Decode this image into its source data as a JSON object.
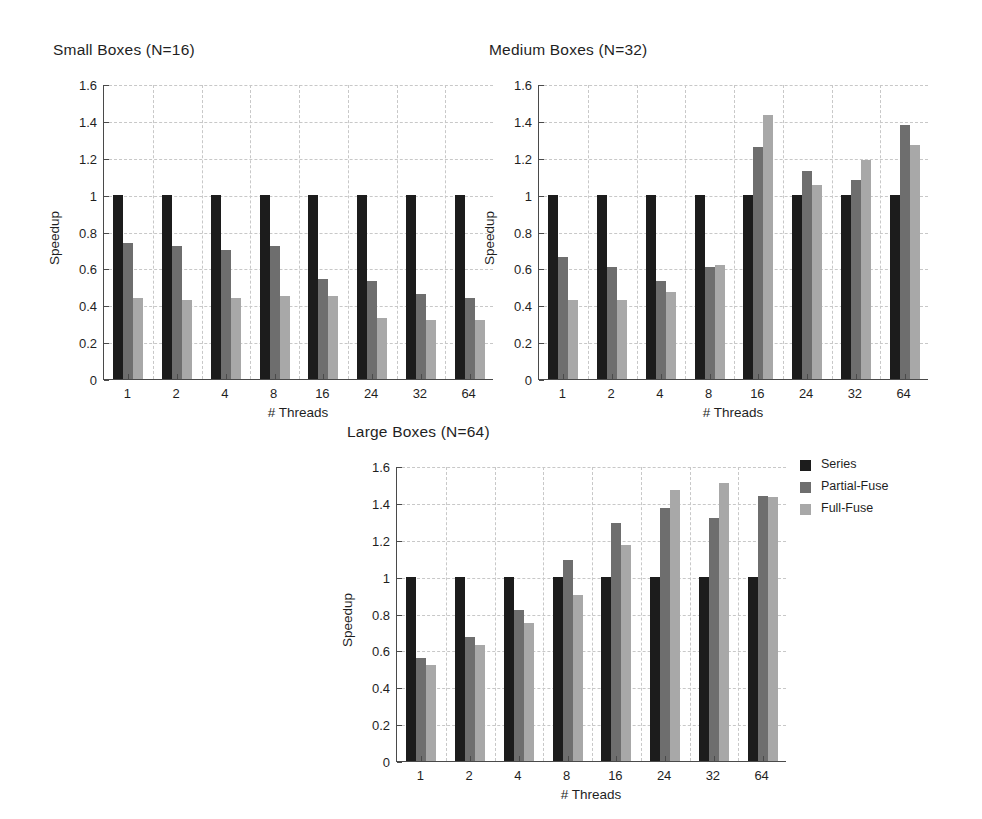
{
  "figure": {
    "width": 982,
    "height": 819,
    "background": "#ffffff"
  },
  "legend": {
    "position": "right-of-third-subplot",
    "entries": [
      {
        "label": "Series",
        "color": "#1c1c1c"
      },
      {
        "label": "Partial-Fuse",
        "color": "#6e6e6e"
      },
      {
        "label": "Full-Fuse",
        "color": "#a8a8a8"
      }
    ]
  },
  "axis": {
    "ylabel": "Speedup",
    "xlabel": "# Threads",
    "yticks": [
      "0",
      "0.2",
      "0.4",
      "0.6",
      "0.8",
      "1",
      "1.2",
      "1.4",
      "1.6"
    ],
    "ytick_values": [
      0,
      0.2,
      0.4,
      0.6,
      0.8,
      1,
      1.2,
      1.4,
      1.6
    ],
    "xticks": [
      "1",
      "2",
      "4",
      "8",
      "16",
      "24",
      "32",
      "64"
    ],
    "ylim": [
      0,
      1.6
    ],
    "grid": true
  },
  "chart_data": [
    {
      "type": "bar",
      "title": "Small Boxes (N=16)",
      "xlabel": "# Threads",
      "ylabel": "Speedup",
      "ylim": [
        0,
        1.6
      ],
      "grid": true,
      "categories": [
        "1",
        "2",
        "4",
        "8",
        "16",
        "24",
        "32",
        "64"
      ],
      "series": [
        {
          "name": "Series",
          "color": "#1c1c1c",
          "values": [
            1.0,
            1.0,
            1.0,
            1.0,
            1.0,
            1.0,
            1.0,
            1.0
          ]
        },
        {
          "name": "Partial-Fuse",
          "color": "#6e6e6e",
          "values": [
            0.74,
            0.72,
            0.7,
            0.72,
            0.54,
            0.53,
            0.46,
            0.44
          ]
        },
        {
          "name": "Full-Fuse",
          "color": "#a8a8a8",
          "values": [
            0.44,
            0.43,
            0.44,
            0.45,
            0.45,
            0.33,
            0.32,
            0.32
          ]
        }
      ]
    },
    {
      "type": "bar",
      "title": "Medium Boxes (N=32)",
      "xlabel": "# Threads",
      "ylabel": "Speedup",
      "ylim": [
        0,
        1.6
      ],
      "grid": true,
      "categories": [
        "1",
        "2",
        "4",
        "8",
        "16",
        "24",
        "32",
        "64"
      ],
      "series": [
        {
          "name": "Series",
          "color": "#1c1c1c",
          "values": [
            1.0,
            1.0,
            1.0,
            1.0,
            1.0,
            1.0,
            1.0,
            1.0
          ]
        },
        {
          "name": "Partial-Fuse",
          "color": "#6e6e6e",
          "values": [
            0.66,
            0.61,
            0.53,
            0.61,
            1.26,
            1.13,
            1.08,
            1.38
          ]
        },
        {
          "name": "Full-Fuse",
          "color": "#a8a8a8",
          "values": [
            0.43,
            0.43,
            0.47,
            0.62,
            1.43,
            1.05,
            1.19,
            1.27
          ]
        }
      ]
    },
    {
      "type": "bar",
      "title": "Large Boxes (N=64)",
      "xlabel": "# Threads",
      "ylabel": "Speedup",
      "ylim": [
        0,
        1.6
      ],
      "grid": true,
      "categories": [
        "1",
        "2",
        "4",
        "8",
        "16",
        "24",
        "32",
        "64"
      ],
      "series": [
        {
          "name": "Series",
          "color": "#1c1c1c",
          "values": [
            1.0,
            1.0,
            1.0,
            1.0,
            1.0,
            1.0,
            1.0,
            1.0
          ]
        },
        {
          "name": "Partial-Fuse",
          "color": "#6e6e6e",
          "values": [
            0.56,
            0.67,
            0.82,
            1.09,
            1.29,
            1.37,
            1.32,
            1.44
          ]
        },
        {
          "name": "Full-Fuse",
          "color": "#a8a8a8",
          "values": [
            0.52,
            0.63,
            0.75,
            0.9,
            1.17,
            1.47,
            1.51,
            1.43
          ]
        }
      ]
    }
  ],
  "subplot_layout": [
    {
      "title_x": 53,
      "title_y": 41,
      "plot_x": 103,
      "plot_y": 85,
      "plot_w": 390,
      "plot_h": 295
    },
    {
      "title_x": 489,
      "title_y": 41,
      "plot_x": 538,
      "plot_y": 85,
      "plot_w": 390,
      "plot_h": 295
    },
    {
      "title_x": 347,
      "title_y": 423,
      "plot_x": 396,
      "plot_y": 467,
      "plot_w": 390,
      "plot_h": 295
    }
  ]
}
